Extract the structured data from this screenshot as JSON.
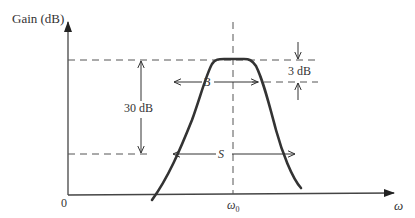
{
  "diagram": {
    "y_axis_label": "Gain (dB)",
    "x_axis_label": "ω",
    "origin_label": "0",
    "center_frequency_label": "ω",
    "center_frequency_subscript": "0",
    "bandwidth_label": "B",
    "bandwidth_attenuation_label": "3 dB",
    "skirt_label": "S",
    "skirt_attenuation_label": "30 dB",
    "colors": {
      "line": "#333333",
      "dashed": "#555555",
      "background": "#ffffff"
    }
  }
}
